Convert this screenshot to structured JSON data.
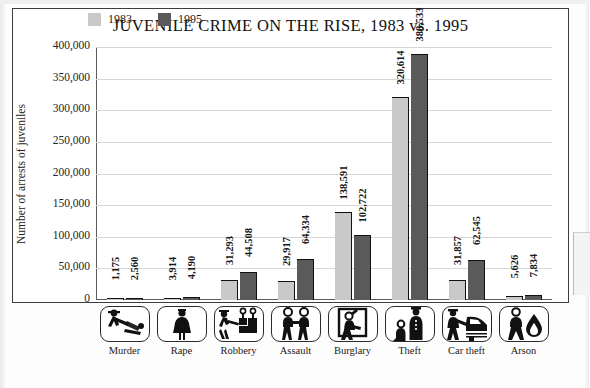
{
  "chart_data": {
    "type": "bar",
    "title": "JUVENILE CRIME ON THE RISE, 1983 vs. 1995",
    "xlabel": "",
    "ylabel": "Number of arrests of juveniles",
    "ylim": [
      0,
      400000
    ],
    "yticks": [
      "400,000",
      "350,000",
      "300,000",
      "250,000",
      "200,000",
      "150,000",
      "100,000",
      "50,000",
      "0"
    ],
    "ytick_values": [
      400000,
      350000,
      300000,
      250000,
      200000,
      150000,
      100000,
      50000,
      0
    ],
    "grid": true,
    "legend_position": "top-center",
    "categories": [
      "Murder",
      "Rape",
      "Robbery",
      "Assault",
      "Burglary",
      "Theft",
      "Car theft",
      "Arson"
    ],
    "series": [
      {
        "name": "1983",
        "color": "#c9c9c9",
        "values": [
          1175,
          3914,
          31293,
          29917,
          138591,
          320614,
          31857,
          5626
        ],
        "labels": [
          "1,175",
          "3,914",
          "31,293",
          "29,917",
          "138,591",
          "320,614",
          "31,857",
          "5,626"
        ]
      },
      {
        "name": "1995",
        "color": "#5a5a5a",
        "values": [
          2560,
          4190,
          44508,
          64334,
          102722,
          388533,
          62545,
          7834
        ],
        "labels": [
          "2,560",
          "4,190",
          "44,508",
          "64,334",
          "102,722",
          "388,533",
          "62,545",
          "7,834"
        ]
      }
    ],
    "icons": [
      "murder-icon",
      "rape-icon",
      "robbery-icon",
      "assault-icon",
      "burglary-icon",
      "theft-icon",
      "car-theft-icon",
      "arson-icon"
    ]
  }
}
